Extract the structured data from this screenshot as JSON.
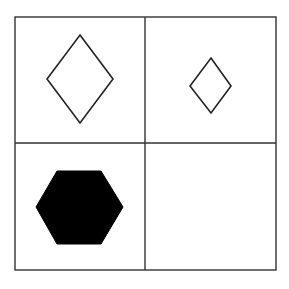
{
  "puzzle": {
    "type": "2x2 figure matrix",
    "grid": {
      "rows": 2,
      "cols": 2,
      "left": 15,
      "top": 17,
      "right": 276,
      "bottom": 270,
      "col_divider_x": 145,
      "row_divider_y": 143,
      "line_color": "#333333"
    },
    "cells": [
      {
        "row": 0,
        "col": 0,
        "shape": "diamond",
        "size": "large",
        "fill": "none",
        "stroke": "#222222",
        "points": "80,35 113,79 80,123 47,79"
      },
      {
        "row": 0,
        "col": 1,
        "shape": "diamond",
        "size": "small",
        "fill": "none",
        "stroke": "#222222",
        "points": "211,58 231,86 211,113 190,86"
      },
      {
        "row": 1,
        "col": 0,
        "shape": "hexagon",
        "size": "large",
        "fill": "#000000",
        "stroke": "#000000",
        "points": "57,171 101,171 123,207 101,244 57,244 36,207"
      },
      {
        "row": 1,
        "col": 1,
        "shape": "empty",
        "size": "",
        "fill": "none",
        "stroke": "none",
        "points": ""
      }
    ]
  }
}
